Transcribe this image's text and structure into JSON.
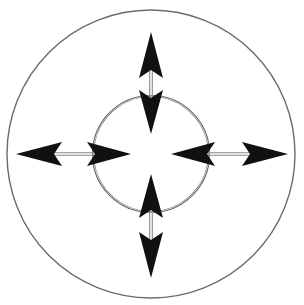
{
  "figure": {
    "description": "A large thin outer circle and a smaller heavier double-stroked inner circle share a common centre. Four straight double-line shafts run along the vertical and horizontal axes. Each shaft carries a large solid black arrowhead pointing outwards at the rim of the outer circle and a second solid black arrowhead pointing inwards toward the centre, just inside the inner circle.",
    "background_color": "#ffffff",
    "width": 304,
    "height": 305
  },
  "geometry": {
    "center": {
      "x": 151,
      "y": 154
    },
    "outer_circle": {
      "label": "outer-circle",
      "radius": 144,
      "stroke_color": "#6b6b6b",
      "stroke_width": 1.4,
      "fill": "none"
    },
    "inner_circle": {
      "label": "inner-circle",
      "radius": 58,
      "stroke_color": "#5a5a5a",
      "stroke_width": 2.2,
      "inner_highlight_color": "#d8d8d8",
      "fill": "none"
    },
    "shaft": {
      "stroke_color": "#8a8a8a",
      "stroke_width": 1.1,
      "separation": 2.6
    },
    "arrowhead": {
      "fill_color": "#111111",
      "outer_length": 30,
      "outer_half_width": 12,
      "inner_length": 27,
      "inner_half_width": 11
    },
    "center_gap_radius": 20
  },
  "arrows": [
    {
      "id": "arrow-up",
      "label": "Vertical upward arrow",
      "direction": "up",
      "angle_deg": 270,
      "outer_tip": {
        "x": 151,
        "y": 32
      },
      "inner_tip": {
        "x": 151,
        "y": 134
      },
      "outer_head_points": "151,32 163,78 151,70 139,78",
      "inner_head_points": "151,134 139,90 151,98 163,90",
      "shaft_from": {
        "x": 151,
        "y": 70
      },
      "shaft_to": {
        "x": 151,
        "y": 98
      }
    },
    {
      "id": "arrow-down",
      "label": "Vertical downward arrow",
      "direction": "down",
      "angle_deg": 90,
      "outer_tip": {
        "x": 151,
        "y": 278
      },
      "inner_tip": {
        "x": 151,
        "y": 174
      },
      "outer_head_points": "151,278 139,232 151,240 163,232",
      "inner_head_points": "151,174 163,218 151,210 139,218",
      "shaft_from": {
        "x": 151,
        "y": 240
      },
      "shaft_to": {
        "x": 151,
        "y": 210
      }
    },
    {
      "id": "arrow-left",
      "label": "Horizontal leftward arrow",
      "direction": "left",
      "angle_deg": 180,
      "outer_tip": {
        "x": 16,
        "y": 154
      },
      "inner_tip": {
        "x": 131,
        "y": 154
      },
      "outer_head_points": "16,154 62,142 54,154 62,166",
      "inner_head_points": "131,154 87,142 95,154 87,166",
      "shaft_from": {
        "x": 54,
        "y": 154
      },
      "shaft_to": {
        "x": 95,
        "y": 154
      }
    },
    {
      "id": "arrow-right",
      "label": "Horizontal rightward arrow",
      "direction": "right",
      "angle_deg": 0,
      "outer_tip": {
        "x": 288,
        "y": 154
      },
      "inner_tip": {
        "x": 171,
        "y": 154
      },
      "outer_head_points": "288,154 242,142 250,154 242,166",
      "inner_head_points": "171,154 215,142 207,154 215,166",
      "shaft_from": {
        "x": 250,
        "y": 154
      },
      "shaft_to": {
        "x": 207,
        "y": 154
      }
    }
  ],
  "labels": {
    "caption": ""
  }
}
